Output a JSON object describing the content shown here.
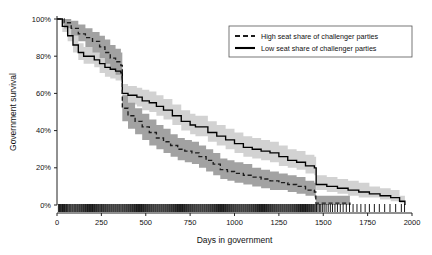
{
  "chart_data": {
    "type": "line",
    "title": "",
    "xlabel": "Days in government",
    "ylabel": "Government survival",
    "xlim": [
      0,
      2000
    ],
    "ylim": [
      0,
      100
    ],
    "xticks": [
      0,
      250,
      500,
      750,
      1000,
      1250,
      1500,
      1750,
      2000
    ],
    "xtick_labels": [
      "0",
      "250",
      "500",
      "750",
      "1000",
      "1250",
      "1500",
      "1750",
      "2000"
    ],
    "yticks": [
      0,
      20,
      40,
      60,
      80,
      100
    ],
    "ytick_labels": [
      "0%",
      "20%",
      "40%",
      "60%",
      "80%",
      "100%"
    ],
    "grid": false,
    "legend_position": "top-right",
    "legend": [
      {
        "label": "High seat share of challenger parties",
        "style": "dashed",
        "color": "#1c1c1c",
        "band_color": "#9d9d9d"
      },
      {
        "label": "Low seat share of challenger parties",
        "style": "solid",
        "color": "#000000",
        "band_color": "#d0d0d0"
      }
    ],
    "series": [
      {
        "name": "High seat share of challenger parties",
        "style": "dashed",
        "x": [
          0,
          40,
          80,
          120,
          160,
          200,
          240,
          270,
          300,
          330,
          360,
          368,
          400,
          440,
          480,
          520,
          560,
          600,
          640,
          680,
          720,
          760,
          800,
          840,
          880,
          920,
          960,
          1000,
          1050,
          1100,
          1150,
          1200,
          1250,
          1300,
          1350,
          1400,
          1450,
          1458,
          1500,
          1560,
          1620,
          1650
        ],
        "y": [
          100,
          98,
          95,
          92,
          90,
          88,
          85,
          82,
          79,
          77,
          75,
          52,
          48,
          45,
          42,
          39,
          36,
          34,
          32,
          30,
          29,
          28,
          26,
          24,
          22,
          19,
          18,
          17,
          16,
          15,
          14,
          13,
          12,
          11,
          10,
          8,
          7,
          1,
          1,
          1,
          1,
          0
        ],
        "ci_lower": [
          100,
          95,
          91,
          88,
          85,
          82,
          79,
          76,
          73,
          70,
          68,
          45,
          41,
          38,
          35,
          32,
          30,
          28,
          26,
          24,
          23,
          22,
          20,
          18,
          16,
          14,
          13,
          12,
          11,
          10,
          9,
          8,
          8,
          7,
          6,
          5,
          4,
          0,
          0,
          0,
          0,
          0
        ],
        "ci_upper": [
          100,
          100,
          99,
          97,
          95,
          93,
          91,
          89,
          86,
          84,
          82,
          59,
          55,
          52,
          49,
          46,
          43,
          41,
          38,
          36,
          35,
          34,
          32,
          30,
          28,
          25,
          24,
          23,
          22,
          20,
          19,
          18,
          17,
          16,
          15,
          13,
          12,
          5,
          5,
          5,
          5,
          4
        ]
      },
      {
        "name": "Low seat share of challenger parties",
        "style": "solid",
        "x": [
          0,
          30,
          60,
          90,
          120,
          150,
          180,
          210,
          240,
          270,
          300,
          330,
          360,
          368,
          400,
          450,
          480,
          520,
          560,
          600,
          650,
          700,
          750,
          780,
          800,
          850,
          900,
          950,
          1000,
          1050,
          1100,
          1150,
          1200,
          1250,
          1300,
          1350,
          1400,
          1450,
          1460,
          1520,
          1580,
          1640,
          1700,
          1760,
          1820,
          1880,
          1930,
          1960
        ],
        "y": [
          100,
          96,
          91,
          86,
          82,
          80,
          80,
          78,
          76,
          74,
          73,
          72,
          71,
          60,
          59,
          58,
          56,
          55,
          53,
          51,
          48,
          45,
          43,
          42,
          42,
          39,
          37,
          35,
          33,
          31,
          30,
          29,
          28,
          26,
          24,
          23,
          21,
          20,
          11,
          10,
          9,
          8,
          7,
          6,
          5,
          4,
          2,
          0
        ],
        "ci_lower": [
          100,
          93,
          88,
          82,
          78,
          76,
          76,
          74,
          71,
          69,
          68,
          67,
          66,
          55,
          54,
          53,
          51,
          50,
          48,
          46,
          43,
          40,
          38,
          37,
          37,
          34,
          32,
          30,
          28,
          26,
          25,
          24,
          23,
          21,
          20,
          19,
          17,
          16,
          8,
          7,
          6,
          5,
          4,
          4,
          3,
          2,
          1,
          0
        ],
        "ci_upper": [
          100,
          100,
          95,
          91,
          87,
          85,
          85,
          83,
          81,
          79,
          78,
          77,
          76,
          65,
          64,
          63,
          62,
          61,
          59,
          57,
          54,
          51,
          49,
          48,
          48,
          45,
          43,
          41,
          39,
          37,
          36,
          35,
          34,
          32,
          30,
          29,
          27,
          26,
          16,
          15,
          14,
          13,
          12,
          10,
          9,
          8,
          5,
          3
        ]
      }
    ],
    "rug": {
      "label": "event marks",
      "y_value": 0,
      "x": [
        8,
        14,
        20,
        26,
        31,
        37,
        42,
        47,
        53,
        58,
        63,
        69,
        74,
        79,
        85,
        90,
        96,
        101,
        106,
        112,
        117,
        123,
        128,
        134,
        139,
        145,
        150,
        156,
        161,
        167,
        172,
        178,
        183,
        189,
        194,
        200,
        205,
        211,
        216,
        222,
        227,
        233,
        238,
        244,
        250,
        255,
        261,
        266,
        272,
        277,
        283,
        288,
        294,
        299,
        305,
        310,
        316,
        321,
        327,
        332,
        338,
        343,
        349,
        354,
        360,
        366,
        371,
        377,
        382,
        388,
        393,
        399,
        404,
        410,
        415,
        421,
        426,
        432,
        437,
        443,
        448,
        454,
        459,
        465,
        470,
        476,
        481,
        487,
        492,
        498,
        503,
        509,
        514,
        520,
        525,
        531,
        536,
        542,
        547,
        553,
        558,
        564,
        569,
        575,
        580,
        586,
        591,
        597,
        602,
        608,
        613,
        619,
        624,
        630,
        635,
        641,
        646,
        652,
        657,
        663,
        668,
        674,
        679,
        685,
        690,
        696,
        701,
        707,
        712,
        718,
        723,
        729,
        734,
        740,
        745,
        751,
        756,
        762,
        767,
        773,
        778,
        784,
        789,
        795,
        800,
        806,
        811,
        817,
        822,
        828,
        833,
        839,
        844,
        850,
        855,
        861,
        866,
        872,
        877,
        883,
        888,
        894,
        899,
        905,
        910,
        916,
        921,
        927,
        932,
        938,
        943,
        949,
        954,
        960,
        965,
        971,
        976,
        982,
        987,
        993,
        998,
        1004,
        1009,
        1015,
        1020,
        1026,
        1031,
        1037,
        1042,
        1048,
        1053,
        1059,
        1064,
        1070,
        1075,
        1081,
        1086,
        1092,
        1097,
        1103,
        1108,
        1114,
        1119,
        1125,
        1130,
        1136,
        1141,
        1147,
        1152,
        1158,
        1163,
        1169,
        1174,
        1180,
        1185,
        1191,
        1196,
        1202,
        1207,
        1213,
        1218,
        1224,
        1229,
        1235,
        1240,
        1246,
        1251,
        1257,
        1262,
        1268,
        1273,
        1279,
        1284,
        1290,
        1295,
        1301,
        1306,
        1312,
        1317,
        1323,
        1328,
        1334,
        1339,
        1345,
        1350,
        1356,
        1361,
        1367,
        1372,
        1378,
        1383,
        1389,
        1394,
        1400,
        1405,
        1411,
        1416,
        1422,
        1427,
        1433,
        1438,
        1444,
        1449,
        1455,
        1462,
        1470,
        1478,
        1486,
        1495,
        1505,
        1516,
        1528,
        1540,
        1552,
        1566,
        1580,
        1596,
        1612,
        1630,
        1648,
        1668,
        1690,
        1712,
        1736,
        1760,
        1788,
        1816,
        1846,
        1876,
        1908,
        1940,
        1958
      ]
    }
  }
}
